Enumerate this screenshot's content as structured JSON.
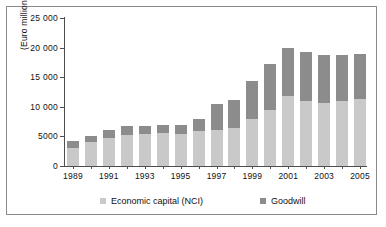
{
  "chart_data": {
    "type": "bar",
    "subtype": "stacked-column",
    "title": "",
    "xlabel": "",
    "ylabel": "(Euro million)",
    "ylim": [
      0,
      25000
    ],
    "ytick_values": [
      0,
      5000,
      10000,
      15000,
      20000,
      25000
    ],
    "ytick_labels": [
      "0",
      "5000",
      "10 000",
      "15 000",
      "20 000",
      "25 000"
    ],
    "grid": false,
    "legend_position": "bottom",
    "categories": [
      "1989",
      "1990",
      "1991",
      "1992",
      "1993",
      "1994",
      "1995",
      "1996",
      "1997",
      "1998",
      "1999",
      "2000",
      "2001",
      "2002",
      "2003",
      "2004",
      "2005"
    ],
    "xtick_labels_shown": [
      "1989",
      "1991",
      "1993",
      "1995",
      "1997",
      "1999",
      "2001",
      "2003",
      "2005"
    ],
    "series": [
      {
        "name": "Economic capital (NCI)",
        "color": "#c9c9c9",
        "values": [
          3000,
          4100,
          4800,
          5300,
          5400,
          5500,
          5400,
          5900,
          6100,
          6500,
          8000,
          9500,
          11800,
          10900,
          10700,
          10900,
          11300
        ]
      },
      {
        "name": "Goodwill",
        "color": "#8c8c8c",
        "values": [
          1200,
          1000,
          1300,
          1500,
          1300,
          1400,
          1500,
          2000,
          4400,
          4700,
          6300,
          7700,
          8100,
          8300,
          8000,
          7800,
          7700
        ]
      }
    ],
    "totals": [
      4200,
      5100,
      6100,
      6800,
      6700,
      6900,
      6900,
      7900,
      10500,
      11200,
      14300,
      17200,
      19900,
      19200,
      18700,
      18700,
      19000
    ]
  },
  "legend": {
    "items": [
      {
        "label": "Economic capital (NCI)",
        "color": "#c9c9c9"
      },
      {
        "label": "Goodwill",
        "color": "#8c8c8c"
      }
    ]
  }
}
